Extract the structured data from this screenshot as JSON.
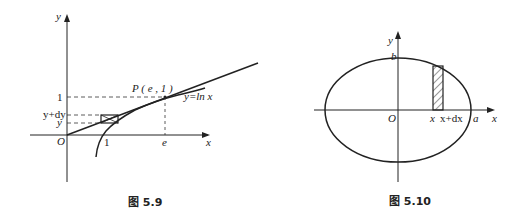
{
  "figures": [
    {
      "caption": "图 5.9",
      "labels": {
        "y_axis": "y",
        "x_axis": "x",
        "origin": "O",
        "one_x": "1",
        "e_x": "e",
        "one_y": "1",
        "y_plus_dy": "y+dy",
        "y": "y",
        "point": "P ( e , 1 )",
        "curve": "y=ln x"
      }
    },
    {
      "caption": "图 5.10",
      "labels": {
        "y_axis": "y",
        "x_axis": "x",
        "origin": "O",
        "b": "b",
        "x": "x",
        "x_plus_dx": "x+dx",
        "a": "a"
      }
    }
  ]
}
